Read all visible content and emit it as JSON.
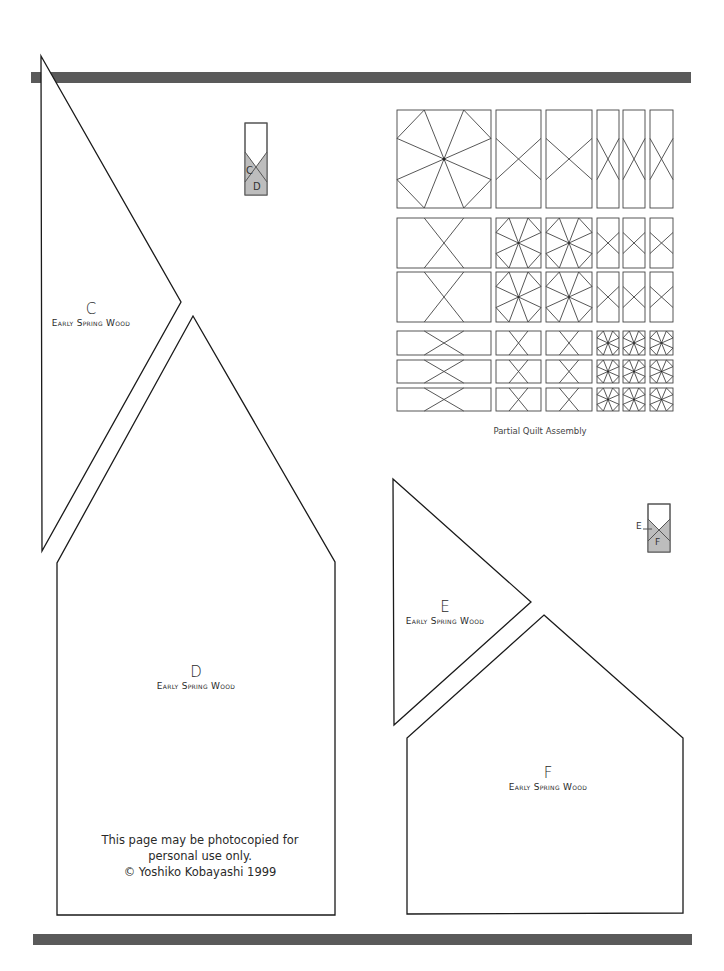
{
  "page": {
    "top_rule_color": "#5a5a5a",
    "bottom_rule_color": "#5a5a5a"
  },
  "pieces": {
    "C": {
      "letter": "C",
      "fabric": "Early Spring Wood"
    },
    "D": {
      "letter": "D",
      "fabric": "Early Spring Wood"
    },
    "E": {
      "letter": "E",
      "fabric": "Early Spring Wood"
    },
    "F": {
      "letter": "F",
      "fabric": "Early Spring Wood"
    }
  },
  "placement_keys": {
    "CD": {
      "top_letter": "C",
      "bottom_letter": "D",
      "shade_color": "#bdbdbd"
    },
    "EF": {
      "top_letter": "E",
      "bottom_letter": "F",
      "shade_color": "#bdbdbd"
    }
  },
  "quilt_assembly": {
    "caption": "Partial Quilt Assembly",
    "rows": [
      [
        "star-square-large",
        "x-rect-tall",
        "x-rect-tall",
        "x-rect-narrow",
        "x-rect-narrow",
        "x-rect-narrow"
      ],
      [
        "x-rect-wide",
        "star-square",
        "star-square",
        "x-rect-narrow",
        "x-rect-narrow",
        "x-rect-narrow"
      ],
      [
        "x-rect-wide",
        "star-square",
        "star-square",
        "x-rect-narrow",
        "x-rect-narrow",
        "x-rect-narrow"
      ],
      [
        "x-strip",
        "x-square",
        "x-square",
        "star-square-small",
        "star-square-small",
        "star-square-small"
      ],
      [
        "x-strip",
        "x-square",
        "x-square",
        "star-square-small",
        "star-square-small",
        "star-square-small"
      ],
      [
        "x-strip",
        "x-square",
        "x-square",
        "star-square-small",
        "star-square-small",
        "star-square-small"
      ]
    ]
  },
  "notice": {
    "line1": "This page may be photocopied for",
    "line2": "personal use only.",
    "line3": "© Yoshiko Kobayashi 1999"
  }
}
